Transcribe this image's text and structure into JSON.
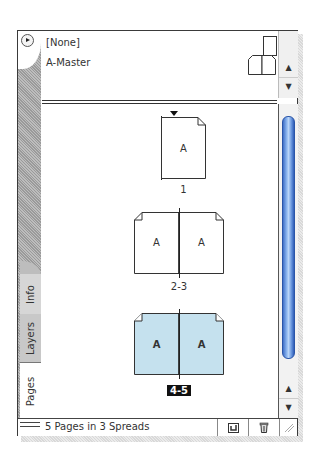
{
  "panel": {
    "menu_icon": "panel-menu-icon",
    "tabs": [
      {
        "label": "Info",
        "active": false
      },
      {
        "label": "Layers",
        "active": false
      },
      {
        "label": "Pages",
        "active": true
      }
    ]
  },
  "masters": {
    "items": [
      {
        "label": "[None]",
        "icon": "single-page-icon"
      },
      {
        "label": "A-Master",
        "icon": "spread-page-icon"
      }
    ]
  },
  "pages": {
    "spreads": [
      {
        "label": "1",
        "pages": [
          {
            "master": "A"
          }
        ],
        "selected": false
      },
      {
        "label": "2-3",
        "pages": [
          {
            "master": "A"
          },
          {
            "master": "A"
          }
        ],
        "selected": false
      },
      {
        "label": "4-5",
        "pages": [
          {
            "master": "A"
          },
          {
            "master": "A"
          }
        ],
        "selected": true
      }
    ]
  },
  "status": {
    "text": "5 Pages in 3 Spreads",
    "buttons": [
      {
        "name": "new-page-button",
        "icon": "new-page-icon"
      },
      {
        "name": "delete-page-button",
        "icon": "trash-icon"
      }
    ]
  },
  "colors": {
    "selected_fill": "#c5e1ee",
    "scroll_thumb": "#5b8ee0",
    "selected_label_bg": "#111111"
  }
}
